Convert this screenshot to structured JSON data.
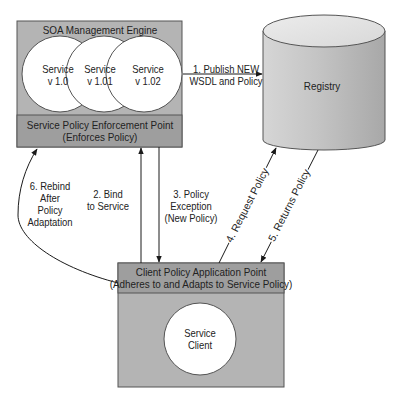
{
  "soa_engine": {
    "title": "SOA Management Engine",
    "services": [
      {
        "line1": "Service",
        "line2": "v 1.0"
      },
      {
        "line1": "Service",
        "line2": "v 1.01"
      },
      {
        "line1": "Service",
        "line2": "v 1.02"
      }
    ],
    "enforcement_point": {
      "line1": "Service Policy Enforcement Point",
      "line2": "(Enforces Policy)"
    }
  },
  "registry": {
    "label": "Registry"
  },
  "client": {
    "application_point": {
      "line1": "Client Policy Application Point",
      "line2": "(Adheres to and Adapts to Service Policy)"
    },
    "service_client": {
      "line1": "Service",
      "line2": "Client"
    }
  },
  "arrows": {
    "publish": {
      "line1": "1. Publish NEW",
      "line2": "WSDL and Policy"
    },
    "bind": {
      "line1": "2. Bind",
      "line2": "to Service"
    },
    "exception": {
      "line1": "3. Policy",
      "line2": "Exception",
      "line3": "(New Policy)"
    },
    "request": {
      "label": "4. Request Policy"
    },
    "returns": {
      "label": "5. Returns Policy"
    },
    "rebind": {
      "line1": "6. Rebind",
      "line2": "After",
      "line3": "Policy",
      "line4": "Adaptation"
    }
  },
  "colors": {
    "box_fill": "#b4b4b4",
    "header_fill": "#9e9e9e",
    "border": "#555555",
    "circle_fill": "#ffffff",
    "line": "#1a1a1a"
  }
}
